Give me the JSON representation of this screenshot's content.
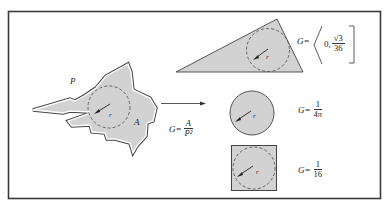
{
  "figure": {
    "colors": {
      "frame": "#3a3a3a",
      "fill": "#d2d2d2",
      "stroke": "#444444",
      "dashed": "#555555"
    },
    "labels": {
      "perimeter": "P",
      "area": "A",
      "radius": "r"
    },
    "general_formula": {
      "lhs": "G=",
      "numerator": "A",
      "denominator": "P²"
    },
    "shapes": [
      {
        "name": "triangle",
        "formula": {
          "lhs": "G=",
          "interval_open": "0,",
          "numerator": "√3",
          "denominator": "36"
        }
      },
      {
        "name": "circle",
        "formula": {
          "lhs": "G=",
          "numerator": "1",
          "denominator": "4π"
        }
      },
      {
        "name": "square",
        "formula": {
          "lhs": "G=",
          "numerator": "1",
          "denominator": "16"
        }
      }
    ]
  }
}
